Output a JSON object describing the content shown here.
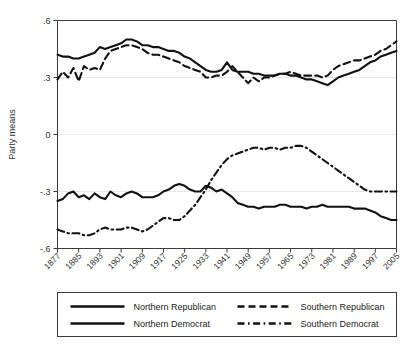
{
  "chart_data": {
    "type": "line",
    "title": "",
    "xlabel": "",
    "ylabel": "Party means",
    "xlim": [
      1877,
      2005
    ],
    "ylim": [
      -0.6,
      0.6
    ],
    "grid": true,
    "legend_position": "bottom",
    "y_ticks": [
      ".6",
      ".3",
      "0",
      "-.3",
      "-.6"
    ],
    "y_tick_values": [
      0.6,
      0.3,
      0,
      -0.3,
      -0.6
    ],
    "x_ticks": [
      "1877",
      "1885",
      "1893",
      "1901",
      "1909",
      "1917",
      "1925",
      "1933",
      "1941",
      "1949",
      "1957",
      "1965",
      "1973",
      "1981",
      "1989",
      "1997",
      "2005"
    ],
    "x_tick_values": [
      1877,
      1885,
      1893,
      1901,
      1909,
      1917,
      1925,
      1933,
      1941,
      1949,
      1957,
      1965,
      1973,
      1981,
      1989,
      1997,
      2005
    ],
    "x": [
      1877,
      1879,
      1881,
      1883,
      1885,
      1887,
      1889,
      1891,
      1893,
      1895,
      1897,
      1899,
      1901,
      1903,
      1905,
      1907,
      1909,
      1911,
      1913,
      1915,
      1917,
      1919,
      1921,
      1923,
      1925,
      1927,
      1929,
      1931,
      1933,
      1935,
      1937,
      1939,
      1941,
      1943,
      1945,
      1947,
      1949,
      1951,
      1953,
      1955,
      1957,
      1959,
      1961,
      1963,
      1965,
      1967,
      1969,
      1971,
      1973,
      1975,
      1977,
      1979,
      1981,
      1983,
      1985,
      1987,
      1989,
      1991,
      1993,
      1995,
      1997,
      1999,
      2001,
      2003,
      2005
    ],
    "series": [
      {
        "name": "Northern Republican",
        "style": "solid",
        "color": "#111111",
        "values": [
          0.42,
          0.41,
          0.41,
          0.4,
          0.4,
          0.41,
          0.42,
          0.43,
          0.46,
          0.45,
          0.46,
          0.47,
          0.48,
          0.5,
          0.5,
          0.49,
          0.47,
          0.47,
          0.46,
          0.46,
          0.45,
          0.44,
          0.44,
          0.43,
          0.41,
          0.4,
          0.38,
          0.36,
          0.34,
          0.33,
          0.33,
          0.34,
          0.38,
          0.34,
          0.33,
          0.33,
          0.33,
          0.32,
          0.32,
          0.31,
          0.31,
          0.31,
          0.32,
          0.32,
          0.31,
          0.31,
          0.3,
          0.29,
          0.29,
          0.28,
          0.27,
          0.26,
          0.28,
          0.3,
          0.31,
          0.32,
          0.33,
          0.34,
          0.36,
          0.38,
          0.39,
          0.41,
          0.42,
          0.43,
          0.44
        ]
      },
      {
        "name": "Southern Republican",
        "style": "dashed",
        "color": "#111111",
        "values": [
          0.29,
          0.33,
          0.3,
          0.35,
          0.28,
          0.36,
          0.34,
          0.35,
          0.34,
          0.4,
          0.44,
          0.45,
          0.46,
          0.47,
          0.47,
          0.46,
          0.45,
          0.43,
          0.42,
          0.42,
          0.41,
          0.4,
          0.39,
          0.38,
          0.36,
          0.35,
          0.34,
          0.33,
          0.3,
          0.3,
          0.31,
          0.31,
          0.33,
          0.36,
          0.33,
          0.3,
          0.27,
          0.3,
          0.28,
          0.3,
          0.3,
          0.31,
          0.32,
          0.32,
          0.33,
          0.32,
          0.31,
          0.31,
          0.31,
          0.31,
          0.3,
          0.31,
          0.34,
          0.36,
          0.37,
          0.38,
          0.39,
          0.39,
          0.4,
          0.41,
          0.42,
          0.44,
          0.45,
          0.47,
          0.49
        ]
      },
      {
        "name": "Northern Democrat",
        "style": "solid",
        "color": "#111111",
        "values": [
          -0.35,
          -0.34,
          -0.31,
          -0.3,
          -0.33,
          -0.32,
          -0.34,
          -0.31,
          -0.33,
          -0.34,
          -0.3,
          -0.32,
          -0.33,
          -0.31,
          -0.3,
          -0.31,
          -0.33,
          -0.33,
          -0.33,
          -0.32,
          -0.3,
          -0.29,
          -0.27,
          -0.26,
          -0.27,
          -0.29,
          -0.3,
          -0.3,
          -0.27,
          -0.28,
          -0.3,
          -0.29,
          -0.31,
          -0.33,
          -0.36,
          -0.37,
          -0.38,
          -0.38,
          -0.39,
          -0.38,
          -0.38,
          -0.38,
          -0.37,
          -0.37,
          -0.38,
          -0.38,
          -0.38,
          -0.39,
          -0.38,
          -0.38,
          -0.37,
          -0.38,
          -0.38,
          -0.38,
          -0.38,
          -0.38,
          -0.39,
          -0.39,
          -0.39,
          -0.4,
          -0.41,
          -0.43,
          -0.44,
          -0.45,
          -0.45
        ]
      },
      {
        "name": "Southern Democrat",
        "style": "dashdot",
        "color": "#111111",
        "values": [
          -0.5,
          -0.51,
          -0.52,
          -0.52,
          -0.52,
          -0.53,
          -0.53,
          -0.52,
          -0.5,
          -0.49,
          -0.5,
          -0.5,
          -0.5,
          -0.49,
          -0.49,
          -0.5,
          -0.51,
          -0.5,
          -0.48,
          -0.46,
          -0.44,
          -0.44,
          -0.45,
          -0.45,
          -0.43,
          -0.4,
          -0.37,
          -0.33,
          -0.29,
          -0.24,
          -0.2,
          -0.16,
          -0.13,
          -0.11,
          -0.1,
          -0.09,
          -0.08,
          -0.07,
          -0.07,
          -0.08,
          -0.07,
          -0.07,
          -0.08,
          -0.07,
          -0.07,
          -0.06,
          -0.06,
          -0.07,
          -0.09,
          -0.11,
          -0.13,
          -0.15,
          -0.17,
          -0.19,
          -0.21,
          -0.23,
          -0.25,
          -0.27,
          -0.29,
          -0.3,
          -0.3,
          -0.3,
          -0.3,
          -0.3,
          -0.3
        ]
      }
    ]
  },
  "legend": {
    "entries": [
      {
        "label": "Northern Republican",
        "style": "solid"
      },
      {
        "label": "Southern Republican",
        "style": "dashed"
      },
      {
        "label": "Northern Democrat",
        "style": "solid"
      },
      {
        "label": "Southern Democrat",
        "style": "dashdot"
      }
    ]
  }
}
